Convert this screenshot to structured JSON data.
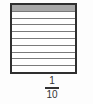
{
  "diagram": {
    "type": "fraction-strip",
    "total_parts": 10,
    "shaded_parts": 1,
    "shaded_color": "#a8a8a8",
    "border_color": "#2f2f2f",
    "line_color": "#7a7a7a"
  },
  "fraction": {
    "numerator": "1",
    "denominator": "10"
  }
}
